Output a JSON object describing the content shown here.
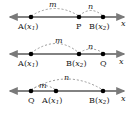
{
  "figure": {
    "axis_label": "x",
    "line_color": "#7a7a7a",
    "point_color": "#000000",
    "arc_color": "#909090"
  },
  "rows": [
    {
      "id": "case-internal",
      "points": [
        {
          "name": "point-a",
          "label_fn": "A(",
          "label_var": "x",
          "label_sub": "1",
          "label_close": ")",
          "x": 31
        },
        {
          "name": "point-p",
          "label_fn": "P",
          "label_var": "",
          "label_sub": "",
          "label_close": "",
          "x": 79
        },
        {
          "name": "point-b",
          "label_fn": "B(",
          "label_var": "x",
          "label_sub": "2",
          "label_close": ")",
          "x": 103
        }
      ],
      "arcs": [
        {
          "name": "arc-m",
          "label": "m",
          "from": 31,
          "to": 79,
          "label_x": 52,
          "label_y": 2
        },
        {
          "name": "arc-n",
          "label": "n",
          "from": 79,
          "to": 103,
          "label_x": 90,
          "label_y": 3
        }
      ]
    },
    {
      "id": "case-external-beyond-b",
      "points": [
        {
          "name": "point-a",
          "label_fn": "A(",
          "label_var": "x",
          "label_sub": "1",
          "label_close": ")",
          "x": 31
        },
        {
          "name": "point-b",
          "label_fn": "B(",
          "label_var": "x",
          "label_sub": "2",
          "label_close": ")",
          "x": 79
        },
        {
          "name": "point-q",
          "label_fn": "Q",
          "label_var": "",
          "label_sub": "",
          "label_close": "",
          "x": 103
        }
      ],
      "arcs": [
        {
          "name": "arc-m",
          "label": "m",
          "from": 31,
          "to": 79,
          "label_x": 57,
          "label_y": 1
        },
        {
          "name": "arc-n",
          "label": "n",
          "from": 79,
          "to": 103,
          "label_x": 90,
          "label_y": 6
        }
      ]
    },
    {
      "id": "case-external-before-a",
      "points": [
        {
          "name": "point-q",
          "label_fn": "Q",
          "label_var": "",
          "label_sub": "",
          "label_close": "",
          "x": 31
        },
        {
          "name": "point-a",
          "label_fn": "A(",
          "label_var": "x",
          "label_sub": "1",
          "label_close": ")",
          "x": 56
        },
        {
          "name": "point-b",
          "label_fn": "B(",
          "label_var": "x",
          "label_sub": "2",
          "label_close": ")",
          "x": 103
        }
      ],
      "arcs": [
        {
          "name": "arc-m",
          "label": "m",
          "from": 31,
          "to": 56,
          "label_x": 41,
          "label_y": 9
        },
        {
          "name": "arc-n",
          "label": "n",
          "from": 31,
          "to": 103,
          "label_x": 66,
          "label_y": 1
        }
      ]
    }
  ]
}
